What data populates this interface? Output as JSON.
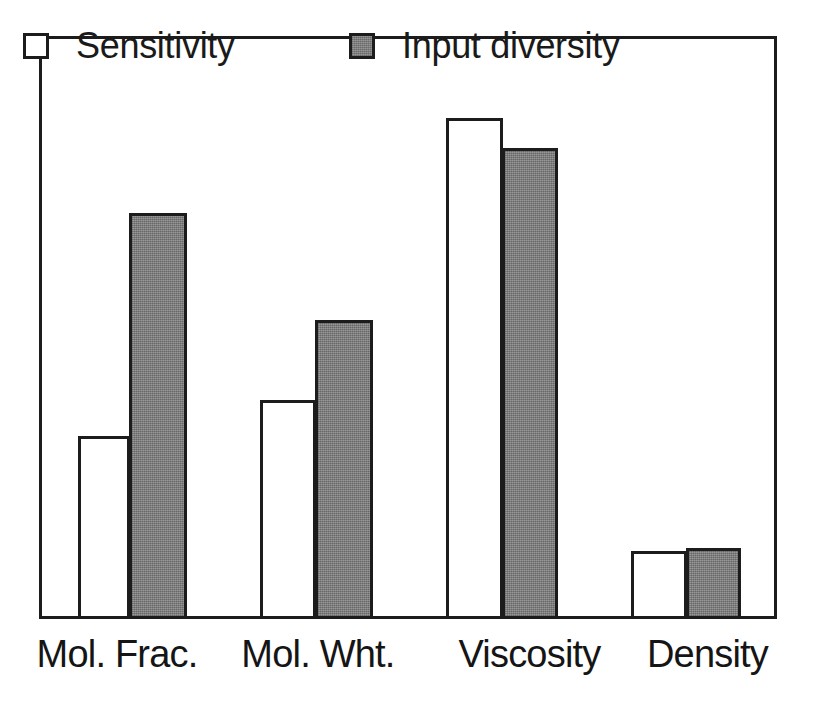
{
  "figure": {
    "background_color": "#ffffff",
    "frame_color": "#1c1c1c",
    "text_color": "#151515"
  },
  "legend": {
    "position": "top-inside",
    "entries": [
      {
        "label": "Sensitivity",
        "swatch": "open-square-icon",
        "color": "#ffffff"
      },
      {
        "label": "Input diversity",
        "swatch": "filled-square-icon",
        "color": "#808080"
      }
    ]
  },
  "axis": {
    "categories": [
      "Mol. Frac.",
      "Mol. Wht.",
      "Viscosity",
      "Density"
    ]
  },
  "chart_data": {
    "type": "bar",
    "title": "",
    "subtitle": "",
    "xlabel": "",
    "ylabel": "",
    "categories": [
      "Mol. Frac.",
      "Mol. Wht.",
      "Viscosity",
      "Density"
    ],
    "series": [
      {
        "name": "Sensitivity",
        "color": "#ffffff",
        "values": [
          36.5,
          44.0,
          100.0,
          13.5
        ]
      },
      {
        "name": "Input diversity",
        "color": "#808080",
        "values": [
          81.0,
          60.0,
          94.0,
          14.0
        ]
      }
    ],
    "ylim": [
      0,
      100
    ],
    "y_axis_ticks_visible": false,
    "grid": false,
    "legend_position": "top-inside",
    "bar_outline_color": "#1c1c1c"
  },
  "geometry": {
    "plot": {
      "left": 39,
      "top": 36,
      "width": 738,
      "height": 583
    },
    "baseline_y": 619,
    "bars": [
      {
        "category": "Mol. Frac.",
        "series": "Sensitivity",
        "x": 78,
        "width": 52,
        "top": 436
      },
      {
        "category": "Mol. Frac.",
        "series": "Input diversity",
        "x": 129,
        "width": 58,
        "top": 213
      },
      {
        "category": "Mol. Wht.",
        "series": "Sensitivity",
        "x": 260,
        "width": 56,
        "top": 400
      },
      {
        "category": "Mol. Wht.",
        "series": "Input diversity",
        "x": 315,
        "width": 58,
        "top": 320
      },
      {
        "category": "Viscosity",
        "series": "Sensitivity",
        "x": 446,
        "width": 57,
        "top": 118
      },
      {
        "category": "Viscosity",
        "series": "Input diversity",
        "x": 502,
        "width": 56,
        "top": 148
      },
      {
        "category": "Density",
        "series": "Sensitivity",
        "x": 631,
        "width": 56,
        "top": 551
      },
      {
        "category": "Density",
        "series": "Input diversity",
        "x": 686,
        "width": 55,
        "top": 548
      }
    ],
    "x_labels": [
      {
        "text": "Mol. Frac.",
        "left": 22,
        "width": 190
      },
      {
        "text": "Mol. Wht.",
        "left": 228,
        "width": 180
      },
      {
        "text": "Viscosity",
        "left": 442,
        "width": 175
      },
      {
        "text": "Density",
        "left": 625,
        "width": 165
      }
    ]
  }
}
